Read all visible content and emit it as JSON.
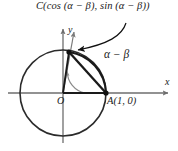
{
  "figure": {
    "type": "unit-circle-angle-difference-diagram",
    "background_color": "#ffffff",
    "stroke_color": "#1a1a1a",
    "axis_color": "#6e6e6e",
    "labels": {
      "point_c": "C(cos (α − β), sin (α − β))",
      "angle": "α − β",
      "point_a": "A(1, 0)",
      "origin": "O",
      "x_axis": "x",
      "y_axis": "y"
    },
    "geometry": {
      "center": [
        63,
        93
      ],
      "radius": 43,
      "point_a": [
        106,
        93
      ],
      "point_c": [
        69,
        52
      ],
      "arc_radius": 22,
      "x_axis_from": [
        8,
        93
      ],
      "x_axis_to": [
        171,
        93
      ],
      "y_axis_from": [
        63,
        140
      ],
      "y_axis_to": [
        63,
        26
      ]
    }
  }
}
